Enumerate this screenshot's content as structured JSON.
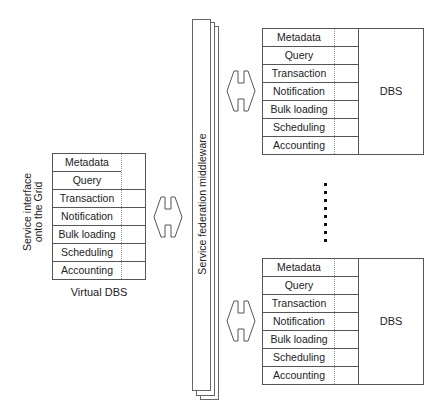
{
  "virtual_dbs": {
    "side_label_line1": "Service interface",
    "side_label_line2": "onto the Grid",
    "caption": "Virtual DBS",
    "services": [
      "Metadata",
      "Query",
      "Transaction",
      "Notification",
      "Bulk loading",
      "Scheduling",
      "Accounting"
    ]
  },
  "middleware": {
    "label": "Service federation middleware"
  },
  "dbs_top": {
    "label": "DBS",
    "services": [
      "Metadata",
      "Query",
      "Transaction",
      "Notification",
      "Bulk loading",
      "Scheduling",
      "Accounting"
    ]
  },
  "dbs_bottom": {
    "label": "DBS",
    "services": [
      "Metadata",
      "Query",
      "Transaction",
      "Notification",
      "Bulk loading",
      "Scheduling",
      "Accounting"
    ]
  },
  "ellipsis": {
    "dot_count": 8
  },
  "colors": {
    "line": "#555555",
    "text": "#222222",
    "background": "#ffffff"
  }
}
